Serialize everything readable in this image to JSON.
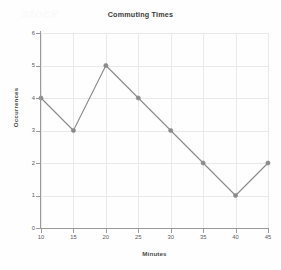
{
  "watermark": {
    "text": "stock"
  },
  "chart_data": {
    "type": "line",
    "title": "Commuting Times",
    "xlabel": "Minutes",
    "ylabel": "Occurrences",
    "x": [
      10,
      15,
      20,
      25,
      30,
      35,
      40,
      45
    ],
    "values": [
      4,
      3,
      5,
      4,
      3,
      2,
      1,
      2
    ],
    "xtick_labels": [
      "10",
      "15",
      "20",
      "25",
      "30",
      "35",
      "40",
      "45"
    ],
    "ytick_labels": [
      "0",
      "1",
      "2",
      "3",
      "4",
      "5",
      "6"
    ],
    "xlim": [
      10,
      45
    ],
    "ylim": [
      0,
      6
    ],
    "grid": true,
    "legend": null,
    "series_color": "#8a8a8a",
    "grid_color": "#e9e9e9",
    "axis_color": "#9a9a9a",
    "marker": "circle"
  }
}
